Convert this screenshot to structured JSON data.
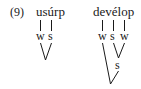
{
  "example_number": "(9)",
  "trees": [
    {
      "word": "usúrp",
      "terminals": [
        "w",
        "s"
      ]
    },
    {
      "word": "devélop",
      "terminals": [
        "w",
        "s",
        "w"
      ],
      "intermediate": [
        "s"
      ]
    }
  ]
}
